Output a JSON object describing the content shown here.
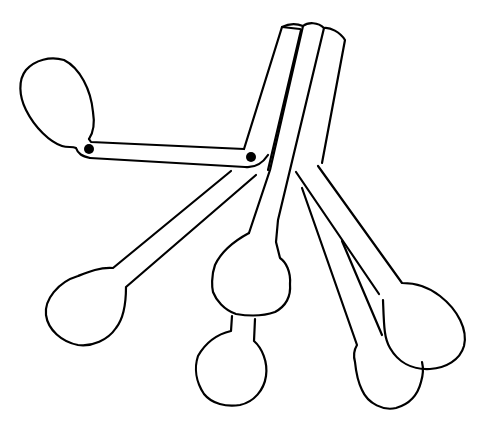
{
  "image": {
    "description": "Line drawing of a set of measuring spoons joined on a ring",
    "background": "#ffffff",
    "stroke_color": "#000000",
    "spoon_count": 6,
    "rivet_count": 2
  }
}
